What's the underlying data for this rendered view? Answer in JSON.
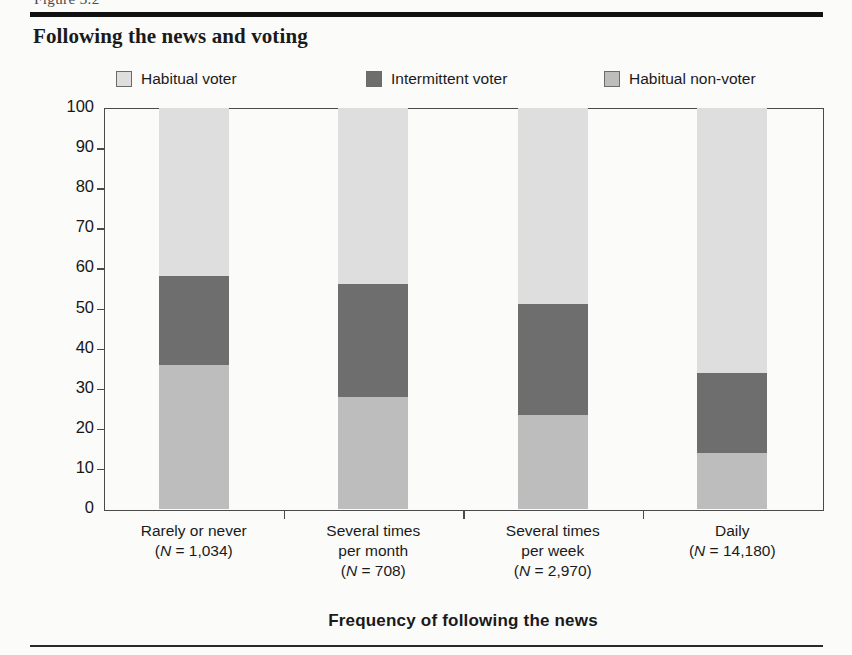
{
  "figure": {
    "figure_tag": "Figure 3.2",
    "title": "Following the news and voting",
    "bottom_rule": true
  },
  "legend": {
    "items": [
      {
        "label": "Habitual voter",
        "color": "#dedede",
        "swatch": "legend-swatch-habitual-voter"
      },
      {
        "label": "Intermittent voter",
        "color": "#6e6e6e",
        "swatch": "legend-swatch-intermittent-voter"
      },
      {
        "label": "Habitual non-voter",
        "color": "#bdbdbd",
        "swatch": "legend-swatch-habitual-non-voter"
      }
    ]
  },
  "axes": {
    "ylabel": "Percentage of voter types",
    "xlabel": "Frequency of following the news",
    "yticks": [
      "100",
      "90",
      "80",
      "70",
      "60",
      "50",
      "40",
      "30",
      "20",
      "10",
      "0"
    ]
  },
  "categories": [
    {
      "line1": "Rarely or never",
      "n_open": "(",
      "n_italic": "N",
      "n_rest": " = 1,034)"
    },
    {
      "line1": "Several times",
      "line2": "per month",
      "n_open": "(",
      "n_italic": "N",
      "n_rest": " = 708)"
    },
    {
      "line1": "Several times",
      "line2": "per week",
      "n_open": "(",
      "n_italic": "N",
      "n_rest": " = 2,970)"
    },
    {
      "line1": "Daily",
      "n_open": "(",
      "n_italic": "N",
      "n_rest": " = 14,180)"
    }
  ],
  "chart_data": {
    "type": "bar",
    "subtype": "stacked-100-percent",
    "title": "Following the news and voting",
    "xlabel": "Frequency of following the news",
    "ylabel": "Percentage of voter types",
    "ylim": [
      0,
      100
    ],
    "ytick_step": 10,
    "grid": false,
    "legend_position": "top",
    "categories": [
      "Rarely or never (N = 1,034)",
      "Several times per month (N = 708)",
      "Several times per week (N = 2,970)",
      "Daily (N = 14,180)"
    ],
    "category_n": [
      1034,
      708,
      2970,
      14180
    ],
    "stack_order_bottom_to_top": [
      "Habitual non-voter",
      "Intermittent voter",
      "Habitual voter"
    ],
    "series": [
      {
        "name": "Habitual non-voter",
        "color": "#bdbdbd",
        "values": [
          36,
          28,
          23.5,
          14
        ]
      },
      {
        "name": "Intermittent voter",
        "color": "#6e6e6e",
        "values": [
          22,
          28,
          27.5,
          20
        ]
      },
      {
        "name": "Habitual voter",
        "color": "#dedede",
        "values": [
          42,
          44,
          49,
          66
        ]
      }
    ],
    "cumulative_tops": {
      "Habitual non-voter": [
        36,
        28,
        23.5,
        14
      ],
      "Intermittent voter": [
        58,
        56,
        51,
        34
      ],
      "Habitual voter": [
        100,
        100,
        100,
        100
      ]
    }
  }
}
